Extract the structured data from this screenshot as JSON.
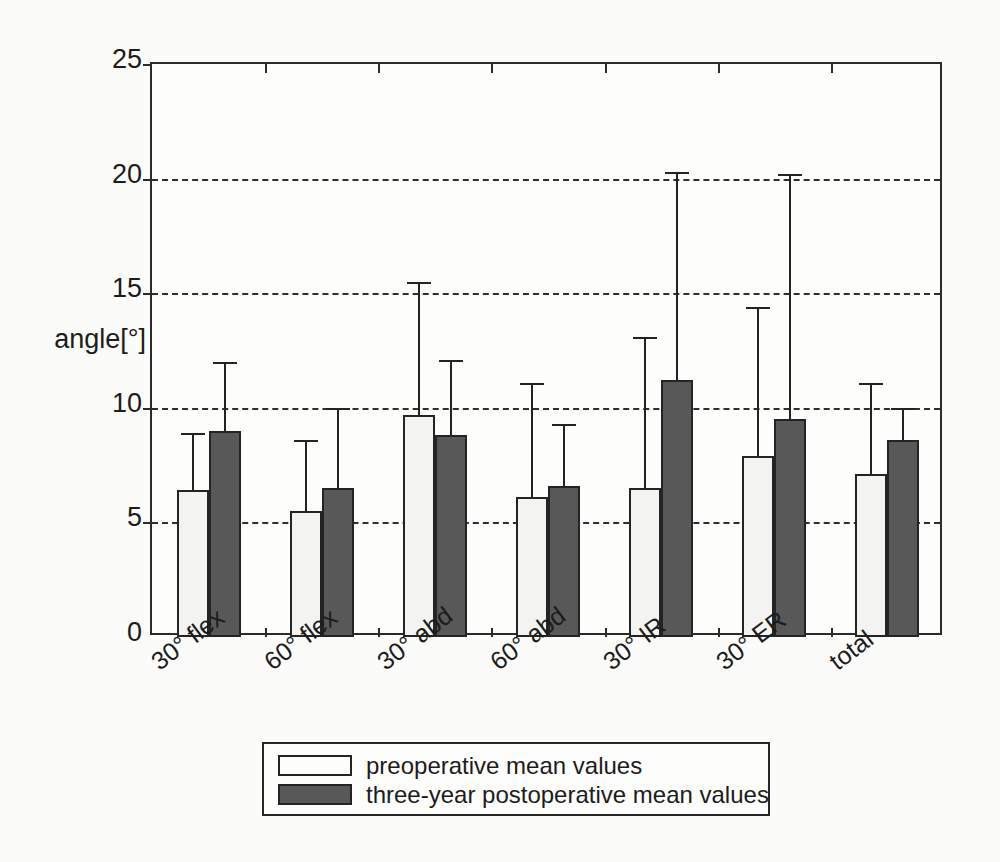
{
  "chart_data": {
    "type": "bar",
    "title": "",
    "subtitle": "",
    "xlabel": "",
    "ylabel": "angle[°]",
    "ylim": [
      0,
      25
    ],
    "yticks": [
      0,
      5,
      10,
      15,
      20,
      25
    ],
    "ytick_labels": [
      "0",
      "5",
      "10",
      "15",
      "20",
      "25"
    ],
    "grid": "horizontal dashed at 5, 10, 15, 20",
    "legend_position": "below-axes-center",
    "error_bars": "upper standard deviation only",
    "categories": [
      "30° flex",
      "60° flex",
      "30° abd",
      "60° abd",
      "30° IR",
      "30° ER",
      "total"
    ],
    "series": [
      {
        "name": "preoperative mean values",
        "color": "#f3f3f1",
        "values": [
          6.4,
          5.5,
          9.7,
          6.1,
          6.5,
          7.9,
          7.1
        ],
        "errors_upper": [
          8.9,
          8.6,
          15.5,
          11.1,
          13.1,
          14.4,
          11.1
        ]
      },
      {
        "name": "three-year postoperative mean values",
        "color": "#585858",
        "values": [
          9.0,
          6.5,
          8.8,
          6.6,
          11.2,
          9.5,
          8.6
        ],
        "errors_upper": [
          12.0,
          10.0,
          12.1,
          9.3,
          20.3,
          20.2,
          10.0
        ]
      }
    ]
  },
  "axis": {
    "y_title": "angle[°]",
    "ticks": [
      "0",
      "5",
      "10",
      "15",
      "20",
      "25"
    ]
  },
  "xaxis": {
    "labels": [
      "30° flex",
      "60° flex",
      "30° abd",
      "60° abd",
      "30° IR",
      "30° ER",
      "total"
    ]
  },
  "legend": {
    "items": [
      {
        "label": "preoperative mean values",
        "swatch": "light-square-swatch"
      },
      {
        "label": "three-year postoperative mean values",
        "swatch": "dark-square-swatch"
      }
    ]
  },
  "colors": {
    "preoperative_fill": "#f3f3f1",
    "postoperative_fill": "#585858",
    "axis_line": "#2b2b2b",
    "gridline": "#2f2f2f",
    "background": "#fbfbf9"
  }
}
